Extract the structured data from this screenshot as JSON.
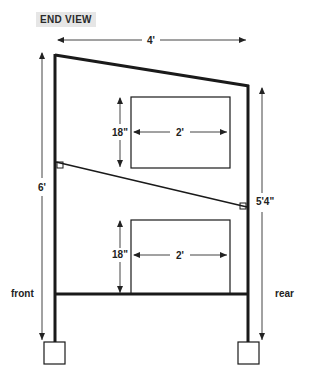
{
  "title": "END VIEW",
  "dimensions": {
    "width_top": "4'",
    "front_height": "6'",
    "rear_height": "5'4\"",
    "upper_window_height": "18\"",
    "upper_window_width": "2'",
    "lower_window_height": "18\"",
    "lower_window_width": "2'"
  },
  "labels": {
    "front": "front",
    "rear": "rear"
  },
  "colors": {
    "structure": "#1a1a1a",
    "dimension_line": "#444444",
    "title_bg": "#e6e6e6"
  }
}
